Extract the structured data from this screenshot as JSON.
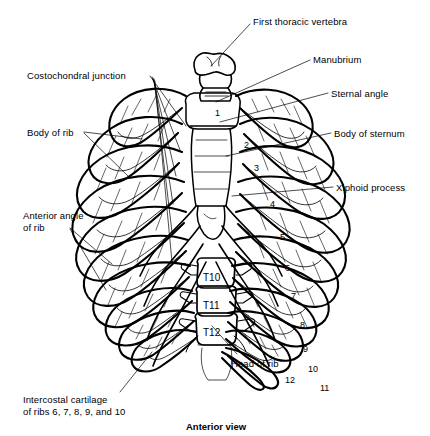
{
  "figure": {
    "title": "Anterior view",
    "background_color": "#ffffff",
    "line_color": "#000000"
  },
  "labels": [
    {
      "id": "first-thoracic-vertebra",
      "text": "First thoracic vertebra",
      "x": 253,
      "y": 16,
      "align": "left"
    },
    {
      "id": "manubrium",
      "text": "Manubrium",
      "x": 313,
      "y": 54,
      "align": "left"
    },
    {
      "id": "sternal-angle",
      "text": "Sternal angle",
      "x": 331,
      "y": 88,
      "align": "left"
    },
    {
      "id": "body-of-sternum",
      "text": "Body of sternum",
      "x": 334,
      "y": 128,
      "align": "left"
    },
    {
      "id": "xiphoid-process",
      "text": "Xiphoid process",
      "x": 336,
      "y": 182,
      "align": "left"
    },
    {
      "id": "costochondral-junction",
      "text": "Costochondral junction",
      "x": 27,
      "y": 70,
      "align": "left"
    },
    {
      "id": "body-of-rib",
      "text": "Body of rib",
      "x": 27,
      "y": 127,
      "align": "left"
    },
    {
      "id": "anterior-angle-of-rib",
      "text": "Anterior angle\nof rib",
      "x": 23,
      "y": 210,
      "align": "left"
    },
    {
      "id": "intercostal-cartilage",
      "text": "Intercostal cartilage\nof ribs 6, 7, 8, 9, and 10",
      "x": 23,
      "y": 394,
      "align": "left"
    },
    {
      "id": "head-of-rib",
      "text": "Head of rib",
      "x": 231,
      "y": 358,
      "align": "left"
    }
  ],
  "vertebra_labels": [
    {
      "id": "T10",
      "text": "T10",
      "x": 203,
      "y": 272
    },
    {
      "id": "T11",
      "text": "T11",
      "x": 203,
      "y": 300
    },
    {
      "id": "T12",
      "text": "T12",
      "x": 203,
      "y": 327
    }
  ],
  "rib_numbers": [
    {
      "id": "rib-1",
      "text": "1",
      "x": 215,
      "y": 108
    },
    {
      "id": "rib-2",
      "text": "2",
      "x": 244,
      "y": 140
    },
    {
      "id": "rib-3",
      "text": "3",
      "x": 254,
      "y": 163
    },
    {
      "id": "rib-4",
      "text": "4",
      "x": 270,
      "y": 199
    },
    {
      "id": "rib-5",
      "text": "5",
      "x": 280,
      "y": 232
    },
    {
      "id": "rib-6",
      "text": "6",
      "x": 285,
      "y": 263
    },
    {
      "id": "rib-7",
      "text": "7",
      "x": 291,
      "y": 291
    },
    {
      "id": "rib-8",
      "text": "8",
      "x": 300,
      "y": 320
    },
    {
      "id": "rib-9",
      "text": "9",
      "x": 303,
      "y": 344
    },
    {
      "id": "rib-10",
      "text": "10",
      "x": 308,
      "y": 364
    },
    {
      "id": "rib-11",
      "text": "11",
      "x": 320,
      "y": 383
    },
    {
      "id": "rib-12",
      "text": "12",
      "x": 285,
      "y": 375
    }
  ],
  "caption": {
    "text": "Anterior view",
    "x": 186,
    "y": 421
  }
}
